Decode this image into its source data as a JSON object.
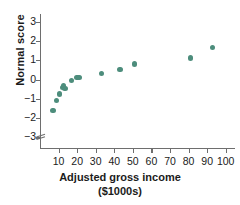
{
  "chart_data": {
    "type": "scatter",
    "title": "",
    "xlabel": "Adjusted gross income",
    "xlabel_units": "($1000s)",
    "ylabel": "Normal score",
    "xlim": [
      0,
      105
    ],
    "ylim": [
      -3.6,
      3.4
    ],
    "xticks": [
      10,
      20,
      30,
      40,
      50,
      60,
      70,
      80,
      90,
      100
    ],
    "xticklabels": [
      "10",
      "20",
      "30",
      "40",
      "50",
      "60",
      "70",
      "80",
      "90",
      "100"
    ],
    "yticks": [
      3,
      2,
      1,
      0,
      -1,
      -2,
      -3
    ],
    "yticklabels": [
      "3",
      "2",
      "1",
      "0",
      "−1",
      "−2",
      "−3"
    ],
    "grid": false,
    "legend": null,
    "axis_break": "y-axis broken below -3",
    "marker_color": "#4d8d7c",
    "axis_color": "#6e6e6e",
    "text_color": "#1b1b1b",
    "x": [
      7,
      9,
      10.5,
      12,
      12.5,
      13.5,
      17,
      20,
      21,
      33,
      43,
      51,
      81,
      93
    ],
    "y": [
      -1.6,
      -1.1,
      -0.75,
      -0.4,
      -0.3,
      -0.45,
      -0.05,
      0.1,
      0.12,
      0.33,
      0.53,
      0.8,
      1.12,
      1.65
    ],
    "points": [
      {
        "x": 7,
        "y": -1.6
      },
      {
        "x": 9,
        "y": -1.1
      },
      {
        "x": 10.5,
        "y": -0.75
      },
      {
        "x": 12,
        "y": -0.4
      },
      {
        "x": 12.5,
        "y": -0.3
      },
      {
        "x": 13.5,
        "y": -0.45
      },
      {
        "x": 17,
        "y": -0.05
      },
      {
        "x": 20,
        "y": 0.1
      },
      {
        "x": 21,
        "y": 0.12
      },
      {
        "x": 33,
        "y": 0.33
      },
      {
        "x": 43,
        "y": 0.53
      },
      {
        "x": 51,
        "y": 0.8
      },
      {
        "x": 81,
        "y": 1.12
      },
      {
        "x": 93,
        "y": 1.65
      }
    ]
  }
}
